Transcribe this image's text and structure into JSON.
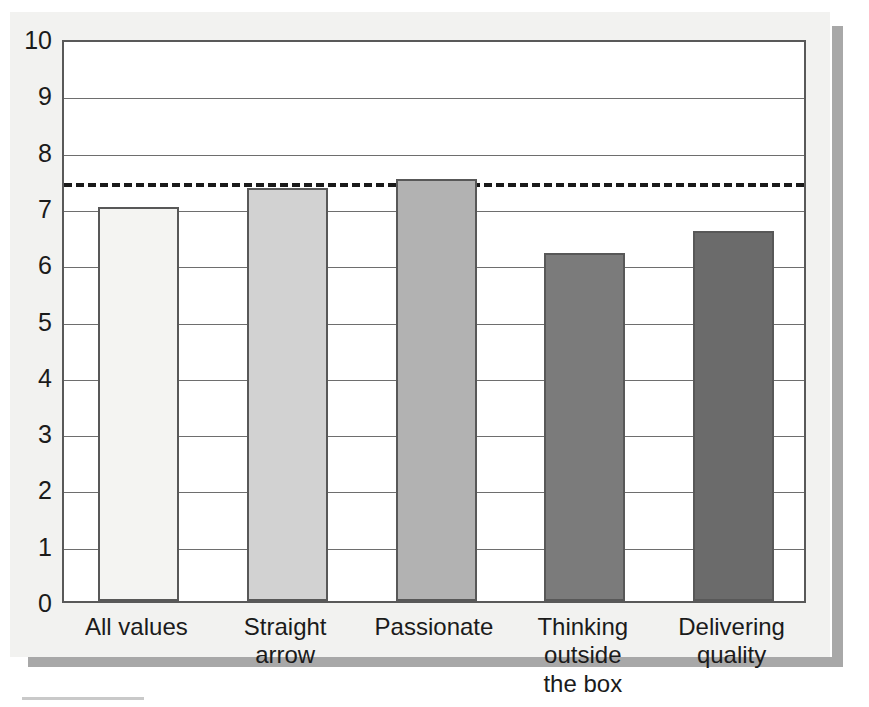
{
  "chart_data": {
    "type": "bar",
    "title": "",
    "subtitle": "",
    "xlabel": "",
    "ylabel": "",
    "categories": [
      "All values",
      "Straight arrow",
      "Passionate",
      "Thinking outside the box",
      "Delivering quality"
    ],
    "category_lines": [
      [
        "All values"
      ],
      [
        "Straight arrow"
      ],
      [
        "Passionate"
      ],
      [
        "Thinking outside",
        "the box"
      ],
      [
        "Delivering",
        "quality"
      ]
    ],
    "values": [
      7.0,
      7.34,
      7.5,
      6.18,
      6.57
    ],
    "bar_colors": [
      "#f4f4f2",
      "#d2d2d2",
      "#b2b2b2",
      "#7b7b7b",
      "#6b6b6b"
    ],
    "bar_edge_color": "#585858",
    "ylim": [
      0,
      10
    ],
    "xlim_note": "5 equally spaced categories",
    "yticks": [
      0,
      1,
      2,
      3,
      4,
      5,
      6,
      7,
      8,
      9,
      10
    ],
    "ytick_labels": [
      "0",
      "1",
      "2",
      "3",
      "4",
      "5",
      "6",
      "7",
      "8",
      "9",
      "10"
    ],
    "grid": true,
    "grid_axis": "y",
    "grid_color": "#6e6e6e",
    "legend": false,
    "legend_position": "none",
    "annotations": [
      {
        "type": "reference-line",
        "orientation": "horizontal",
        "value": 7.5,
        "style": "dashed",
        "color": "#1a1a1a",
        "label": ""
      }
    ],
    "plot_background": "#ffffff",
    "figure_background": "#f2f2f0",
    "frame_color": "#595959"
  },
  "figure": {
    "shadow_color": "#a8a8a8",
    "caption_rule_color": "#c9c9c9"
  }
}
